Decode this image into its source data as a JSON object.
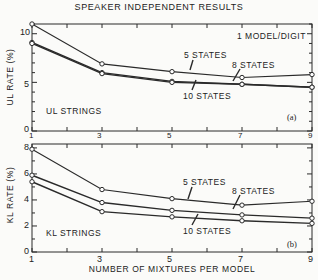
{
  "chart_data": [
    {
      "type": "line",
      "title": "SPEAKER INDEPENDENT RESULTS",
      "panel_label": "(a)",
      "subtitle": "1 MODEL/DIGIT",
      "annotation": "UL STRINGS",
      "xlabel": "NUMBER OF MIXTURES PER MODEL",
      "ylabel": "UL RATE (%)",
      "x": [
        1,
        3,
        5,
        7,
        9
      ],
      "xlim": [
        1,
        9
      ],
      "ylim": [
        0,
        11
      ],
      "yticks": [
        0,
        5,
        10
      ],
      "xticks": [
        1,
        3,
        5,
        7,
        9
      ],
      "grid": false,
      "series": [
        {
          "name": "5 STATES",
          "values": [
            11.0,
            6.9,
            6.1,
            5.5,
            5.8
          ]
        },
        {
          "name": "8 STATES",
          "values": [
            9.1,
            6.0,
            5.1,
            4.8,
            4.5
          ]
        },
        {
          "name": "10 STATES",
          "values": [
            9.0,
            5.9,
            5.0,
            4.8,
            4.5
          ]
        }
      ]
    },
    {
      "type": "line",
      "panel_label": "(b)",
      "annotation": "KL STRINGS",
      "xlabel": "NUMBER OF MIXTURES PER MODEL",
      "ylabel": "KL RATE (%)",
      "x": [
        1,
        3,
        5,
        7,
        9
      ],
      "xlim": [
        1,
        9
      ],
      "ylim": [
        0,
        8
      ],
      "yticks": [
        0,
        2,
        4,
        6,
        8
      ],
      "xticks": [
        1,
        3,
        5,
        7,
        9
      ],
      "grid": false,
      "series": [
        {
          "name": "5 STATES",
          "values": [
            7.9,
            4.8,
            4.1,
            3.6,
            3.9
          ]
        },
        {
          "name": "8 STATES",
          "values": [
            5.9,
            3.8,
            3.2,
            2.85,
            2.6
          ]
        },
        {
          "name": "10 STATES",
          "values": [
            5.4,
            3.1,
            2.7,
            2.4,
            2.2
          ]
        }
      ]
    }
  ],
  "figure": {
    "title": "SPEAKER INDEPENDENT RESULTS",
    "xlabel": "NUMBER OF MIXTURES PER MODEL",
    "top": {
      "ylabel": "UL RATE (%)",
      "note": "1 MODEL/DIGIT",
      "annotation": "UL STRINGS",
      "panel": "(a)",
      "labels": {
        "s5": "5 STATES",
        "s8": "8 STATES",
        "s10": "10 STATES"
      },
      "yticks": [
        "0",
        "5",
        "10"
      ]
    },
    "bottom": {
      "ylabel": "KL RATE (%)",
      "annotation": "KL STRINGS",
      "panel": "(b)",
      "labels": {
        "s5": "5 STATES",
        "s8": "8 STATES",
        "s10": "10 STATES"
      },
      "yticks": [
        "0",
        "2",
        "4",
        "6",
        "8"
      ]
    },
    "xticks": [
      "1",
      "3",
      "5",
      "7",
      "9"
    ],
    "colors": {
      "ink": "#2a2a2a",
      "paper": "#fbfbf9"
    }
  }
}
